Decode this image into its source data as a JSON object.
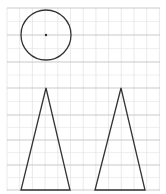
{
  "diagram": {
    "width": 166,
    "height": 194,
    "grid": {
      "x0": 7,
      "y0": 8,
      "x1": 160,
      "y1": 191,
      "minor_spacing": 12.7,
      "minor_color": "#e4e4e4",
      "major_color": "#c9c9c9",
      "major_rows_y": [
        8,
        35,
        62,
        88,
        115,
        140,
        165,
        190
      ]
    },
    "shapes": [
      {
        "type": "circle",
        "name": "circle",
        "cx": 46,
        "cy": 35,
        "r": 25,
        "stroke": "#333333",
        "center_dot": true
      },
      {
        "type": "triangle",
        "name": "triangle-left",
        "points": [
          [
            46,
            88
          ],
          [
            21,
            190
          ],
          [
            70,
            190
          ]
        ],
        "stroke": "#333333"
      },
      {
        "type": "triangle",
        "name": "triangle-right",
        "points": [
          [
            121,
            88
          ],
          [
            95,
            190
          ],
          [
            145,
            190
          ]
        ],
        "stroke": "#333333"
      }
    ]
  }
}
